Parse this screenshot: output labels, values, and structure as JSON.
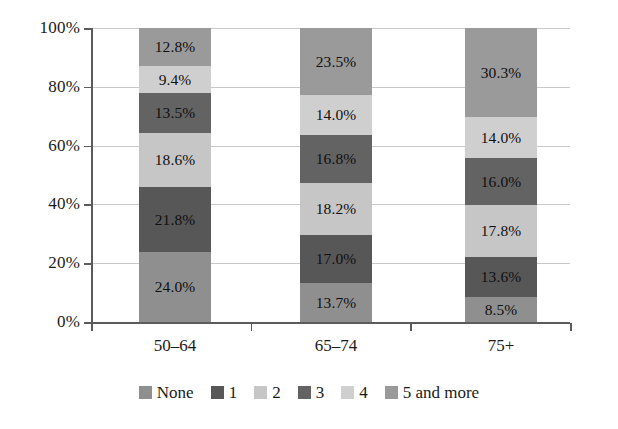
{
  "chart_data": {
    "type": "bar",
    "subtype": "stacked-percentage-column",
    "title": "",
    "subtitle": "",
    "xlabel": "",
    "ylabel": "",
    "categories": [
      "50–64",
      "65–74",
      "75+"
    ],
    "ylim": [
      0,
      100
    ],
    "ytick_labels": [
      "0%",
      "20%",
      "40%",
      "60%",
      "80%",
      "100%"
    ],
    "ytick_values": [
      0,
      20,
      40,
      60,
      80,
      100
    ],
    "grid": true,
    "legend_position": "bottom",
    "value_suffix": "%",
    "series": [
      {
        "name": "None",
        "color": "#8f8f8f",
        "values": [
          24.0,
          13.7,
          8.5
        ],
        "labels": [
          "24.0%",
          "13.7%",
          "8.5%"
        ]
      },
      {
        "name": "1",
        "color": "#575757",
        "values": [
          21.8,
          17.0,
          13.6
        ],
        "labels": [
          "21.8%",
          "17.0%",
          "13.6%"
        ]
      },
      {
        "name": "2",
        "color": "#c6c6c6",
        "values": [
          18.6,
          18.2,
          17.8
        ],
        "labels": [
          "18.6%",
          "18.2%",
          "17.8%"
        ]
      },
      {
        "name": "3",
        "color": "#636363",
        "values": [
          13.5,
          16.8,
          16.0
        ],
        "labels": [
          "13.5%",
          "16.8%",
          "16.0%"
        ]
      },
      {
        "name": "4",
        "color": "#cfcfcf",
        "values": [
          9.4,
          14.0,
          14.0
        ],
        "labels": [
          "9.4%",
          "14.0%",
          "14.0%"
        ]
      },
      {
        "name": "5 and more",
        "color": "#9a9a9a",
        "values": [
          12.8,
          23.5,
          30.3
        ],
        "labels": [
          "12.8%",
          "23.5%",
          "30.3%"
        ]
      }
    ]
  },
  "legend": {
    "items": [
      {
        "label": "None",
        "color": "#8f8f8f"
      },
      {
        "label": "1",
        "color": "#575757"
      },
      {
        "label": "2",
        "color": "#c6c6c6"
      },
      {
        "label": "3",
        "color": "#636363"
      },
      {
        "label": "4",
        "color": "#cfcfcf"
      },
      {
        "label": "5 and more",
        "color": "#9a9a9a"
      }
    ]
  },
  "axes": {
    "y": {
      "ticks": [
        {
          "label": "100%",
          "value": 100
        },
        {
          "label": "80%",
          "value": 80
        },
        {
          "label": "60%",
          "value": 60
        },
        {
          "label": "40%",
          "value": 40
        },
        {
          "label": "20%",
          "value": 20
        },
        {
          "label": "0%",
          "value": 0
        }
      ]
    },
    "x": {
      "ticks": [
        {
          "label": "50–64"
        },
        {
          "label": "65–74"
        },
        {
          "label": "75+"
        }
      ]
    }
  },
  "style": {
    "background": "#ffffff",
    "gridline_color": "#c9c9c9",
    "axis_color": "#5b5b5b",
    "text_color": "#1a1a1a"
  }
}
